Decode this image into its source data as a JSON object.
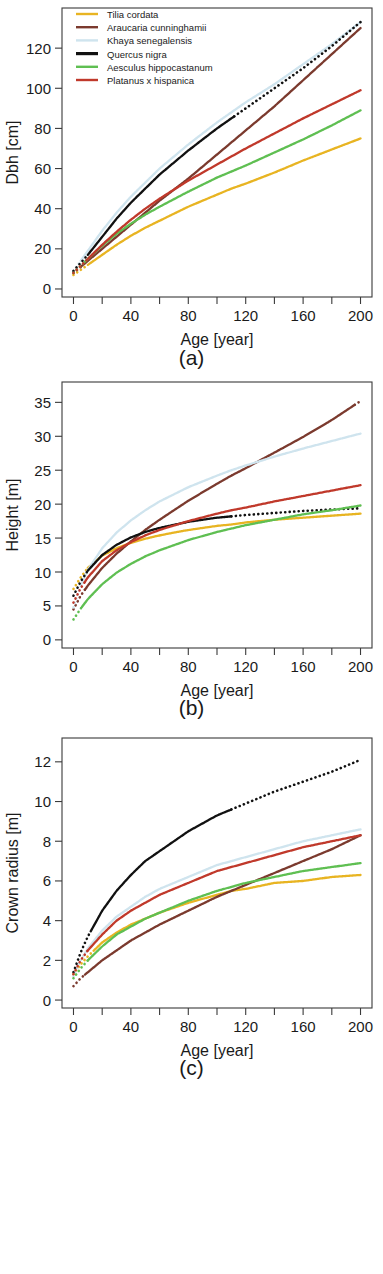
{
  "figure": {
    "species_legend": [
      {
        "name": "Tilia cordata",
        "color": "#E8B422"
      },
      {
        "name": "Araucaria cunninghamii",
        "color": "#7B3A2E"
      },
      {
        "name": "Khaya senegalensis",
        "color": "#CFE4EE"
      },
      {
        "name": "Quercus nigra",
        "color": "#111111"
      },
      {
        "name": "Aesculus hippocastanum",
        "color": "#5FBF52"
      },
      {
        "name": "Platanus x hispanica",
        "color": "#C0392B"
      }
    ],
    "captions": {
      "a": "(a)",
      "b": "(b)",
      "c": "(c)"
    }
  },
  "chart_data": [
    {
      "type": "line",
      "panel": "a",
      "title": "",
      "xlabel": "Age [year]",
      "ylabel": "Dbh [cm]",
      "xlim": [
        -8,
        208
      ],
      "ylim": [
        -4,
        140
      ],
      "xticks": [
        0,
        20,
        40,
        60,
        80,
        100,
        120,
        140,
        160,
        180,
        200
      ],
      "xticklabels": [
        "0",
        "",
        "40",
        "",
        "80",
        "",
        "120",
        "",
        "160",
        "",
        "200"
      ],
      "yticks": [
        0,
        20,
        40,
        60,
        80,
        100,
        120
      ],
      "yticklabels": [
        "0",
        "20",
        "40",
        "60",
        "80",
        "100",
        "120"
      ],
      "grid": false,
      "legend_position": "top-left",
      "x": [
        0,
        5,
        10,
        20,
        30,
        40,
        50,
        60,
        80,
        100,
        110,
        120,
        140,
        160,
        180,
        200
      ],
      "series": [
        {
          "name": "Tilia cordata",
          "color": "#E8B422",
          "solid_from": 10,
          "solid_to": 200,
          "values": [
            7,
            9.5,
            12,
            17,
            22,
            26.5,
            30.5,
            34,
            41,
            47,
            50,
            52.5,
            58,
            64,
            69.5,
            75
          ]
        },
        {
          "name": "Araucaria cunninghamii",
          "color": "#7B3A2E",
          "solid_from": 5,
          "solid_to": 200,
          "values": [
            8,
            11,
            14,
            20,
            26,
            32,
            38,
            44,
            55,
            67,
            73,
            79,
            91,
            104,
            117,
            130
          ]
        },
        {
          "name": "Khaya senegalensis",
          "color": "#CFE4EE",
          "solid_from": 5,
          "solid_to": 200,
          "values": [
            9,
            14,
            19,
            29,
            38,
            46,
            53,
            60,
            72,
            83,
            88,
            93,
            102,
            112,
            122,
            133
          ]
        },
        {
          "name": "Quercus nigra",
          "color": "#111111",
          "solid_from": 10,
          "solid_to": 112,
          "values": [
            9,
            13,
            17,
            26,
            35,
            43,
            50,
            57,
            69,
            80,
            85,
            90,
            100,
            110,
            121,
            133
          ]
        },
        {
          "name": "Aesculus hippocastanum",
          "color": "#5FBF52",
          "solid_from": 8,
          "solid_to": 200,
          "values": [
            8,
            11.5,
            15,
            21.5,
            27.5,
            32.5,
            37,
            41,
            48.5,
            55.5,
            58.5,
            61.5,
            68,
            74.5,
            81.5,
            89
          ]
        },
        {
          "name": "Platanus x hispanica",
          "color": "#C0392B",
          "solid_from": 10,
          "solid_to": 200,
          "values": [
            8,
            11.5,
            15,
            22,
            28.5,
            34.5,
            40,
            45,
            54,
            62,
            66,
            70,
            77.5,
            85,
            92,
            99
          ]
        }
      ]
    },
    {
      "type": "line",
      "panel": "b",
      "title": "",
      "xlabel": "Age [year]",
      "ylabel": "Height [m]",
      "xlim": [
        -8,
        208
      ],
      "ylim": [
        -1.2,
        38
      ],
      "xticks": [
        0,
        20,
        40,
        60,
        80,
        100,
        120,
        140,
        160,
        180,
        200
      ],
      "xticklabels": [
        "0",
        "",
        "40",
        "",
        "80",
        "",
        "120",
        "",
        "160",
        "",
        "200"
      ],
      "yticks": [
        0,
        5,
        10,
        15,
        20,
        25,
        30,
        35
      ],
      "yticklabels": [
        "0",
        "5",
        "10",
        "15",
        "20",
        "25",
        "30",
        "35"
      ],
      "grid": false,
      "legend_position": "none",
      "x": [
        0,
        5,
        10,
        20,
        30,
        40,
        50,
        60,
        80,
        100,
        110,
        120,
        140,
        160,
        180,
        200
      ],
      "series": [
        {
          "name": "Tilia cordata",
          "color": "#E8B422",
          "solid_from": 10,
          "solid_to": 200,
          "values": [
            7.5,
            9.2,
            10.6,
            12.4,
            13.5,
            14.3,
            14.9,
            15.4,
            16.2,
            16.8,
            17.0,
            17.3,
            17.7,
            18.0,
            18.3,
            18.6
          ]
        },
        {
          "name": "Araucaria cunninghamii",
          "color": "#7B3A2E",
          "solid_from": 8,
          "solid_to": 196,
          "values": [
            4.5,
            6.5,
            8.0,
            10.6,
            12.7,
            14.5,
            16.2,
            17.7,
            20.5,
            23.0,
            24.2,
            25.3,
            27.6,
            29.9,
            32.4,
            35.2
          ]
        },
        {
          "name": "Khaya senegalensis",
          "color": "#CFE4EE",
          "solid_from": 5,
          "solid_to": 200,
          "values": [
            4.8,
            8.0,
            10.3,
            13.5,
            15.8,
            17.6,
            19.1,
            20.4,
            22.5,
            24.2,
            25.0,
            25.7,
            27.0,
            28.2,
            29.3,
            30.4
          ]
        },
        {
          "name": "Quercus nigra",
          "color": "#111111",
          "solid_from": 10,
          "solid_to": 110,
          "values": [
            6.5,
            8.6,
            10.2,
            12.5,
            14.0,
            15.1,
            15.9,
            16.5,
            17.4,
            18.0,
            18.2,
            18.4,
            18.7,
            19.0,
            19.2,
            19.4
          ]
        },
        {
          "name": "Aesculus hippocastanum",
          "color": "#5FBF52",
          "solid_from": 6,
          "solid_to": 200,
          "values": [
            3.0,
            4.6,
            6.0,
            8.2,
            9.9,
            11.2,
            12.3,
            13.2,
            14.7,
            15.9,
            16.4,
            16.9,
            17.7,
            18.5,
            19.1,
            19.8
          ]
        },
        {
          "name": "Platanus x hispanica",
          "color": "#C0392B",
          "solid_from": 8,
          "solid_to": 200,
          "values": [
            5.5,
            7.6,
            9.2,
            11.6,
            13.2,
            14.4,
            15.4,
            16.2,
            17.5,
            18.6,
            19.1,
            19.5,
            20.4,
            21.2,
            22.0,
            22.8
          ]
        }
      ]
    },
    {
      "type": "line",
      "panel": "c",
      "title": "",
      "xlabel": "Age [year]",
      "ylabel": "Crown radius [m]",
      "xlim": [
        -8,
        208
      ],
      "ylim": [
        -0.4,
        13.2
      ],
      "xticks": [
        0,
        20,
        40,
        60,
        80,
        100,
        120,
        140,
        160,
        180,
        200
      ],
      "xticklabels": [
        "0",
        "",
        "40",
        "",
        "80",
        "",
        "120",
        "",
        "160",
        "",
        "200"
      ],
      "yticks": [
        0,
        2,
        4,
        6,
        8,
        10,
        12
      ],
      "yticklabels": [
        "0",
        "2",
        "4",
        "6",
        "8",
        "10",
        "12"
      ],
      "grid": false,
      "legend_position": "none",
      "x": [
        0,
        5,
        10,
        20,
        30,
        40,
        50,
        60,
        80,
        100,
        110,
        120,
        140,
        160,
        180,
        200
      ],
      "series": [
        {
          "name": "Tilia cordata",
          "color": "#E8B422",
          "solid_from": 14,
          "solid_to": 200,
          "values": [
            1.3,
            1.8,
            2.2,
            2.9,
            3.4,
            3.8,
            4.1,
            4.4,
            4.9,
            5.3,
            5.5,
            5.6,
            5.9,
            6.0,
            6.2,
            6.3
          ]
        },
        {
          "name": "Araucaria cunninghamii",
          "color": "#7B3A2E",
          "solid_from": 8,
          "solid_to": 200,
          "values": [
            0.7,
            1.1,
            1.4,
            2.0,
            2.5,
            3.0,
            3.4,
            3.8,
            4.5,
            5.2,
            5.5,
            5.8,
            6.4,
            7.0,
            7.6,
            8.3
          ]
        },
        {
          "name": "Khaya senegalensis",
          "color": "#CFE4EE",
          "solid_from": 8,
          "solid_to": 200,
          "values": [
            1.2,
            2.0,
            2.6,
            3.5,
            4.2,
            4.7,
            5.2,
            5.6,
            6.2,
            6.8,
            7.0,
            7.2,
            7.6,
            8.0,
            8.3,
            8.6
          ]
        },
        {
          "name": "Quercus nigra",
          "color": "#111111",
          "solid_from": 12,
          "solid_to": 110,
          "values": [
            1.4,
            2.4,
            3.2,
            4.5,
            5.5,
            6.3,
            7.0,
            7.5,
            8.5,
            9.3,
            9.6,
            9.9,
            10.5,
            11.0,
            11.5,
            12.1
          ]
        },
        {
          "name": "Aesculus hippocastanum",
          "color": "#5FBF52",
          "solid_from": 10,
          "solid_to": 200,
          "values": [
            1.1,
            1.6,
            2.0,
            2.7,
            3.3,
            3.7,
            4.1,
            4.4,
            5.0,
            5.5,
            5.7,
            5.9,
            6.2,
            6.5,
            6.7,
            6.9
          ]
        },
        {
          "name": "Platanus x hispanica",
          "color": "#C0392B",
          "solid_from": 10,
          "solid_to": 200,
          "values": [
            1.3,
            2.0,
            2.5,
            3.3,
            4.0,
            4.5,
            4.9,
            5.3,
            5.9,
            6.5,
            6.7,
            6.9,
            7.3,
            7.7,
            8.0,
            8.3
          ]
        }
      ]
    }
  ]
}
